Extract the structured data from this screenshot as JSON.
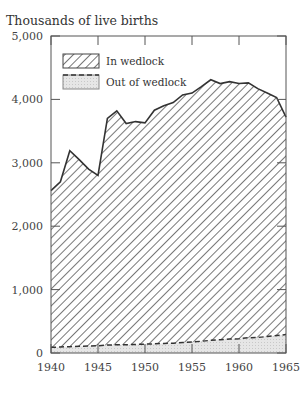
{
  "chart_data": {
    "type": "area",
    "title": "",
    "ylabel": "Thousands of live births",
    "xlabel": "",
    "xlim": [
      1940,
      1965
    ],
    "ylim": [
      0,
      5000
    ],
    "x_ticks": [
      1940,
      1945,
      1950,
      1955,
      1960,
      1965
    ],
    "x_tick_labels": [
      "1940",
      "1945",
      "1950",
      "1955",
      "1960",
      "1965"
    ],
    "y_ticks": [
      0,
      1000,
      2000,
      3000,
      4000,
      5000
    ],
    "y_tick_labels": [
      "0",
      "1,000",
      "2,000",
      "3,000",
      "4,000",
      "5,000"
    ],
    "grid": false,
    "legend_position": "upper left",
    "stacked": true,
    "x": [
      1940,
      1941,
      1942,
      1943,
      1944,
      1945,
      1946,
      1947,
      1948,
      1949,
      1950,
      1951,
      1952,
      1953,
      1954,
      1955,
      1956,
      1957,
      1958,
      1959,
      1960,
      1961,
      1962,
      1963,
      1964,
      1965
    ],
    "series": [
      {
        "name": "Out of wedlock",
        "style": "light gray fill, dashed top line",
        "values": [
          90,
          95,
          100,
          105,
          110,
          115,
          125,
          130,
          130,
          135,
          140,
          145,
          150,
          155,
          165,
          175,
          185,
          200,
          210,
          220,
          225,
          240,
          245,
          260,
          275,
          290
        ]
      },
      {
        "name": "Total (In wedlock + Out of wedlock)",
        "style": "diagonal hatch, solid top line",
        "values": [
          2560,
          2700,
          3190,
          3050,
          2900,
          2800,
          3700,
          3820,
          3620,
          3650,
          3630,
          3830,
          3900,
          3950,
          4070,
          4100,
          4200,
          4310,
          4250,
          4280,
          4250,
          4260,
          4170,
          4100,
          4030,
          3720
        ]
      }
    ],
    "legend": [
      {
        "label": "In wedlock",
        "pattern": "hatched"
      },
      {
        "label": "Out of wedlock",
        "pattern": "gray-dashed"
      }
    ]
  },
  "labels": {
    "y_title": "Thousands of live births",
    "legend_in": "In wedlock",
    "legend_out": "Out of wedlock"
  }
}
